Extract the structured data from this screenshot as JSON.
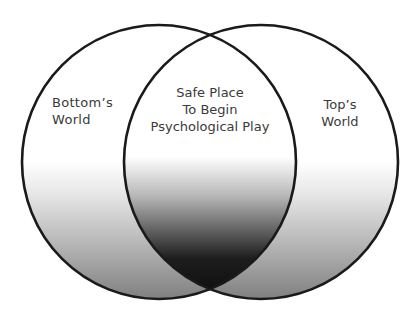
{
  "diagram": {
    "type": "venn",
    "sets": [
      {
        "id": "left",
        "label_lines": [
          "Bottom’s",
          "World"
        ]
      },
      {
        "id": "right",
        "label_lines": [
          "Top’s",
          "World"
        ]
      }
    ],
    "intersection": {
      "label_lines": [
        "Safe Place",
        "To Begin",
        "Psychological Play"
      ]
    },
    "colors": {
      "stroke": "#1a1a1a",
      "gradient_top": "#ffffff",
      "gradient_bottom_outer": "#8a8a8a",
      "gradient_bottom_intersection": "#111111",
      "text": "#3a3a3a"
    }
  }
}
